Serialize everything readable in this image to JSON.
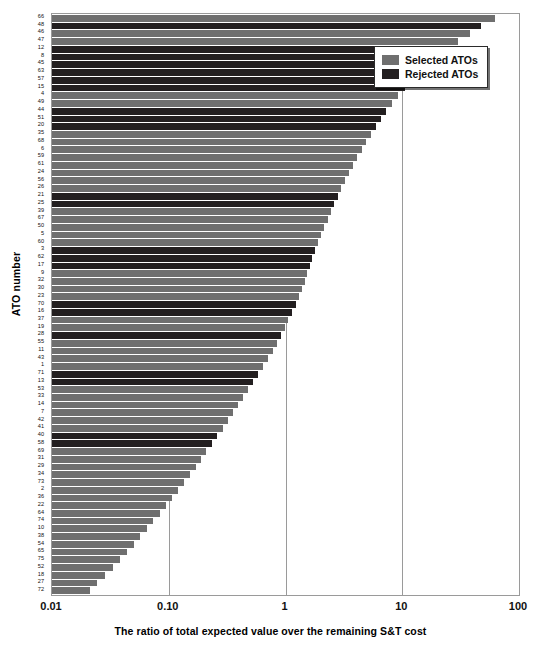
{
  "chart_data": {
    "type": "bar",
    "orientation": "horizontal",
    "title": "",
    "xlabel": "The ratio of total expected value over the remaining S&T cost",
    "ylabel": "ATO number",
    "xscale": "log",
    "xlim": [
      0.01,
      100
    ],
    "xticks": [
      0.01,
      0.1,
      1,
      10,
      100
    ],
    "xticklabels": [
      "0.01",
      "0.10",
      "1",
      "10",
      "100"
    ],
    "grid": "vertical-only",
    "legend": {
      "position": "top-right",
      "entries": [
        {
          "label": "Selected ATOs",
          "color": "#6f6f6f",
          "key": "selected"
        },
        {
          "label": "Rejected ATOs",
          "color": "#231f20",
          "key": "rejected"
        }
      ]
    },
    "categories": [
      "66",
      "48",
      "46",
      "47",
      "12",
      "8",
      "45",
      "63",
      "57",
      "15",
      "4",
      "49",
      "44",
      "51",
      "20",
      "35",
      "68",
      "6",
      "59",
      "61",
      "24",
      "56",
      "26",
      "21",
      "25",
      "39",
      "67",
      "50",
      "5",
      "60",
      "3",
      "62",
      "17",
      "9",
      "32",
      "30",
      "23",
      "70",
      "16",
      "37",
      "19",
      "28",
      "55",
      "11",
      "43",
      "1",
      "71",
      "13",
      "53",
      "33",
      "14",
      "7",
      "42",
      "41",
      "40",
      "58",
      "69",
      "31",
      "29",
      "34",
      "73",
      "2",
      "36",
      "22",
      "64",
      "74",
      "10",
      "38",
      "54",
      "65",
      "75",
      "52",
      "18",
      "27",
      "72"
    ],
    "values": [
      62.0,
      47.0,
      38.0,
      30.0,
      23.0,
      19.0,
      16.5,
      14.0,
      12.0,
      10.5,
      9.2,
      8.2,
      7.3,
      6.6,
      6.0,
      5.4,
      4.9,
      4.5,
      4.1,
      3.8,
      3.5,
      3.25,
      3.0,
      2.8,
      2.6,
      2.45,
      2.3,
      2.15,
      2.0,
      1.9,
      1.8,
      1.7,
      1.62,
      1.54,
      1.46,
      1.38,
      1.3,
      1.22,
      1.14,
      1.06,
      0.99,
      0.92,
      0.85,
      0.78,
      0.71,
      0.645,
      0.585,
      0.53,
      0.48,
      0.435,
      0.395,
      0.355,
      0.32,
      0.29,
      0.26,
      0.235,
      0.21,
      0.19,
      0.17,
      0.152,
      0.135,
      0.12,
      0.107,
      0.095,
      0.084,
      0.074,
      0.065,
      0.057,
      0.05,
      0.0435,
      0.038,
      0.033,
      0.0285,
      0.0245,
      0.021
    ],
    "series_keys": [
      "selected",
      "rejected",
      "selected",
      "selected",
      "rejected",
      "rejected",
      "rejected",
      "rejected",
      "rejected",
      "rejected",
      "selected",
      "selected",
      "rejected",
      "rejected",
      "rejected",
      "selected",
      "selected",
      "selected",
      "selected",
      "selected",
      "selected",
      "selected",
      "selected",
      "rejected",
      "rejected",
      "selected",
      "selected",
      "selected",
      "selected",
      "selected",
      "rejected",
      "rejected",
      "rejected",
      "selected",
      "selected",
      "selected",
      "selected",
      "rejected",
      "rejected",
      "selected",
      "selected",
      "rejected",
      "selected",
      "selected",
      "selected",
      "selected",
      "rejected",
      "rejected",
      "selected",
      "selected",
      "selected",
      "selected",
      "selected",
      "selected",
      "rejected",
      "rejected",
      "selected",
      "selected",
      "selected",
      "selected",
      "selected",
      "selected",
      "selected",
      "selected",
      "selected",
      "selected",
      "selected",
      "selected",
      "selected",
      "selected",
      "selected",
      "selected",
      "selected",
      "selected",
      "selected"
    ]
  }
}
